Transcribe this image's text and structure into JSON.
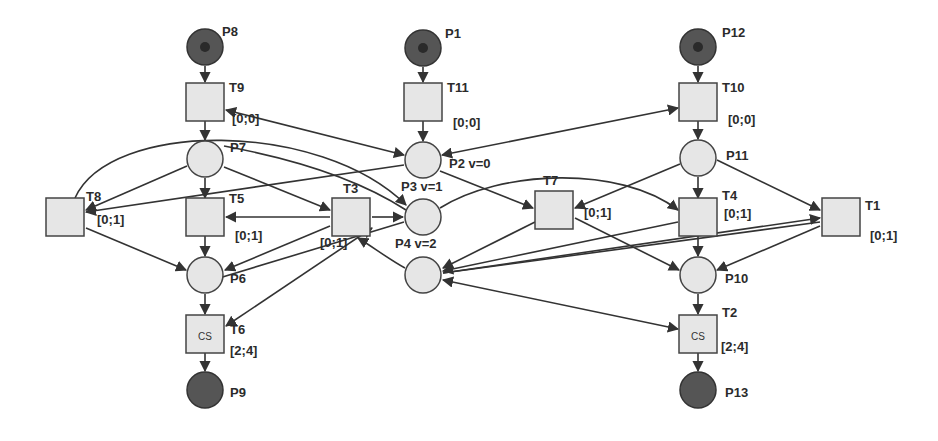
{
  "diagram": {
    "type": "petri-net",
    "colors": {
      "place_fill": "#e6e6e6",
      "marked_place_fill": "#555555",
      "transition_fill": "#e6e6e6",
      "stroke": "#333333",
      "background": "#ffffff"
    },
    "places": [
      {
        "id": "P8",
        "label": "P8",
        "x": 205,
        "y": 47,
        "marked": true,
        "token": true,
        "lx": 222,
        "ly": 36
      },
      {
        "id": "P7",
        "label": "P7",
        "x": 205,
        "y": 159,
        "marked": false,
        "token": false,
        "lx": 230,
        "ly": 152
      },
      {
        "id": "P6",
        "label": "P6",
        "x": 205,
        "y": 275,
        "marked": false,
        "token": false,
        "lx": 230,
        "ly": 283
      },
      {
        "id": "P9",
        "label": "P9",
        "x": 205,
        "y": 390,
        "marked": true,
        "token": false,
        "lx": 230,
        "ly": 397
      },
      {
        "id": "P1",
        "label": "P1",
        "x": 423,
        "y": 48,
        "marked": true,
        "token": true,
        "lx": 445,
        "ly": 38
      },
      {
        "id": "P2",
        "label": "P2  v=0",
        "x": 423,
        "y": 160,
        "marked": false,
        "token": false,
        "lx": 449,
        "ly": 168
      },
      {
        "id": "P3",
        "label": "P3  v=1",
        "x": 423,
        "y": 217,
        "marked": false,
        "token": false,
        "lx": 401,
        "ly": 191
      },
      {
        "id": "P4",
        "label": "P4  v=2",
        "x": 423,
        "y": 275,
        "marked": false,
        "token": false,
        "lx": 395,
        "ly": 248
      },
      {
        "id": "P12",
        "label": "P12",
        "x": 698,
        "y": 47,
        "marked": true,
        "token": true,
        "lx": 722,
        "ly": 37
      },
      {
        "id": "P11",
        "label": "P11",
        "x": 698,
        "y": 158,
        "marked": false,
        "token": false,
        "lx": 726,
        "ly": 160
      },
      {
        "id": "P10",
        "label": "P10",
        "x": 698,
        "y": 275,
        "marked": false,
        "token": false,
        "lx": 725,
        "ly": 283
      },
      {
        "id": "P13",
        "label": "P13",
        "x": 698,
        "y": 390,
        "marked": true,
        "token": false,
        "lx": 725,
        "ly": 397
      }
    ],
    "transitions": [
      {
        "id": "T9",
        "label": "T9",
        "x": 205,
        "y": 102,
        "interval": "[0;0]",
        "inner": "",
        "lx": 229,
        "ly": 92,
        "ix": 232,
        "iy": 123
      },
      {
        "id": "T5",
        "label": "T5",
        "x": 205,
        "y": 217,
        "interval": "[0;1]",
        "inner": "",
        "lx": 229,
        "ly": 203,
        "ix": 235,
        "iy": 240
      },
      {
        "id": "T6",
        "label": "T6",
        "x": 205,
        "y": 334,
        "interval": "[2;4]",
        "inner": "CS",
        "lx": 230,
        "ly": 334,
        "ix": 230,
        "iy": 355
      },
      {
        "id": "T8",
        "label": "T8",
        "x": 65,
        "y": 217,
        "interval": "[0;1]",
        "inner": "",
        "lx": 86,
        "ly": 201,
        "ix": 97,
        "iy": 224
      },
      {
        "id": "T3",
        "label": "T3",
        "x": 351,
        "y": 217,
        "interval": "[0;1]",
        "inner": "",
        "lx": 343,
        "ly": 193,
        "ix": 320,
        "iy": 247
      },
      {
        "id": "T11",
        "label": "T11",
        "x": 423,
        "y": 102,
        "interval": "[0;0]",
        "inner": "",
        "lx": 447,
        "ly": 92,
        "ix": 453,
        "iy": 127
      },
      {
        "id": "T7",
        "label": "T7",
        "x": 554,
        "y": 210,
        "interval": "[0;1]",
        "inner": "",
        "lx": 543,
        "ly": 185,
        "ix": 584,
        "iy": 217
      },
      {
        "id": "T10",
        "label": "T10",
        "x": 698,
        "y": 102,
        "interval": "[0;0]",
        "inner": "",
        "lx": 722,
        "ly": 92,
        "ix": 728,
        "iy": 124
      },
      {
        "id": "T4",
        "label": "T4",
        "x": 698,
        "y": 217,
        "interval": "[0;1]",
        "inner": "",
        "lx": 722,
        "ly": 200,
        "ix": 724,
        "iy": 218
      },
      {
        "id": "T2",
        "label": "T2",
        "x": 698,
        "y": 334,
        "interval": "[2;4]",
        "inner": "CS",
        "lx": 722,
        "ly": 317,
        "ix": 721,
        "iy": 351
      },
      {
        "id": "T1",
        "label": "T1",
        "x": 841,
        "y": 217,
        "interval": "[0;1]",
        "inner": "",
        "lx": 865,
        "ly": 210,
        "ix": 870,
        "iy": 240
      }
    ],
    "arcs": [
      {
        "d": "M205,66 L205,82",
        "end": true,
        "start": false
      },
      {
        "d": "M205,121 L205,140",
        "end": true,
        "start": false
      },
      {
        "d": "M205,178 L205,198",
        "end": true,
        "start": false
      },
      {
        "d": "M205,236 L205,256",
        "end": true,
        "start": false
      },
      {
        "d": "M205,294 L205,314",
        "end": true,
        "start": false
      },
      {
        "d": "M205,353 L205,371",
        "end": true,
        "start": false
      },
      {
        "d": "M423,67 L423,82",
        "end": true,
        "start": false
      },
      {
        "d": "M423,121 L423,141",
        "end": true,
        "start": false
      },
      {
        "d": "M698,66 L698,82",
        "end": true,
        "start": false
      },
      {
        "d": "M698,121 L698,139",
        "end": true,
        "start": false
      },
      {
        "d": "M698,177 L698,198",
        "end": true,
        "start": false
      },
      {
        "d": "M698,236 L698,256",
        "end": true,
        "start": false
      },
      {
        "d": "M698,294 L698,314",
        "end": true,
        "start": false
      },
      {
        "d": "M698,353 L698,371",
        "end": true,
        "start": false
      },
      {
        "d": "M404,155 L226,110",
        "end": true,
        "start": true
      },
      {
        "d": "M442,155 L678,108",
        "end": true,
        "start": true
      },
      {
        "d": "M187,166 L86,210",
        "end": true,
        "start": false
      },
      {
        "d": "M404,165 L86,212",
        "end": true,
        "start": false
      },
      {
        "d": "M75,198 C110,120 320,120 406,205",
        "end": true,
        "start": false
      },
      {
        "d": "M224,167 L330,210",
        "end": true,
        "start": false
      },
      {
        "d": "M224,146 C300,160 360,180 406,210",
        "end": false,
        "start": false
      },
      {
        "d": "M330,217 L226,217",
        "end": true,
        "start": false
      },
      {
        "d": "M372,217 L403,217",
        "end": true,
        "start": false
      },
      {
        "d": "M86,228 L186,270",
        "end": true,
        "start": false
      },
      {
        "d": "M330,226 L225,270",
        "end": true,
        "start": false
      },
      {
        "d": "M372,228 L226,326",
        "end": true,
        "start": true
      },
      {
        "d": "M404,222 L206,282",
        "end": false,
        "start": false
      },
      {
        "d": "M405,268 C390,260 370,245 358,238",
        "end": true,
        "start": false
      },
      {
        "d": "M440,171 L533,208",
        "end": true,
        "start": false
      },
      {
        "d": "M680,164 L575,208",
        "end": true,
        "start": false
      },
      {
        "d": "M440,208 C500,170 620,165 678,210",
        "end": true,
        "start": false
      },
      {
        "d": "M535,222 L443,268",
        "end": true,
        "start": false
      },
      {
        "d": "M575,218 L679,270",
        "end": true,
        "start": false
      },
      {
        "d": "M678,222 L443,271",
        "end": true,
        "start": false
      },
      {
        "d": "M820,222 L443,273",
        "end": false,
        "start": false
      },
      {
        "d": "M717,160 L820,210",
        "end": true,
        "start": false
      },
      {
        "d": "M443,273 L820,218",
        "end": true,
        "start": false
      },
      {
        "d": "M820,226 L717,270",
        "end": true,
        "start": false
      },
      {
        "d": "M443,280 L678,329",
        "end": true,
        "start": true
      }
    ]
  }
}
